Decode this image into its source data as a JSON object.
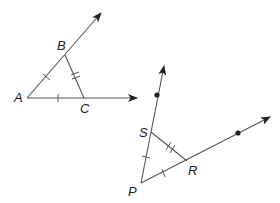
{
  "diagram": {
    "figures": [
      {
        "name": "triangle-ABC",
        "vertices": {
          "A": [
            27,
            98
          ],
          "B": [
            65,
            55
          ],
          "C": [
            84,
            98
          ]
        },
        "rays": [
          "AB",
          "AC"
        ],
        "congruence_marks": {
          "AB": 1,
          "AC": 1,
          "BC": 2
        }
      },
      {
        "name": "triangle-PSR",
        "vertices": {
          "P": [
            141,
            183
          ],
          "S": [
            151,
            132
          ],
          "R": [
            187,
            161
          ]
        },
        "rays": [
          "PS",
          "PR"
        ],
        "points_on_rays": 2,
        "congruence_marks": {
          "PS": 1,
          "PR": 1,
          "SR": 2
        }
      }
    ],
    "labels": {
      "A": "A",
      "B": "B",
      "C": "C",
      "P": "P",
      "S": "S",
      "R": "R"
    },
    "colors": {
      "stroke": "#555555",
      "text": "#222222",
      "background": "#ffffff"
    }
  }
}
